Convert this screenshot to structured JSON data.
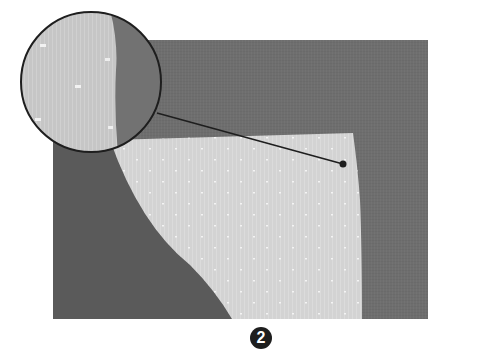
{
  "figure": {
    "step_number": "2",
    "colors": {
      "background": "#ffffff",
      "gray_cloth": "#6e6e6e",
      "dark_shadow": "#575757",
      "fabric": "#d2d2d2",
      "outline": "#1e1e1e"
    },
    "callout": {
      "shape": "circle",
      "center": [
        91,
        82
      ],
      "radius": 70,
      "leader_target": [
        343,
        164
      ]
    }
  }
}
